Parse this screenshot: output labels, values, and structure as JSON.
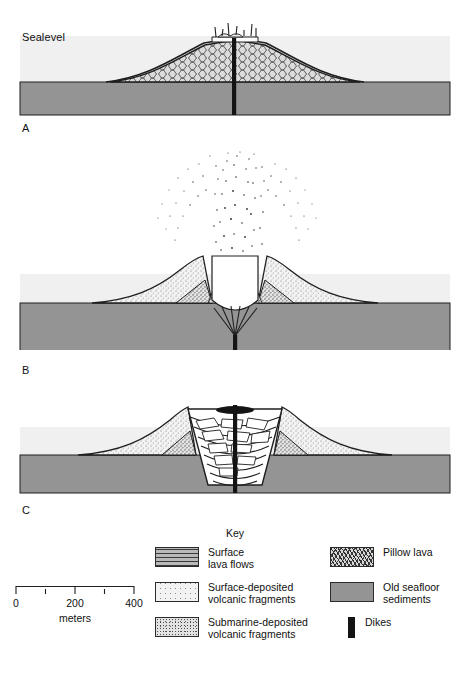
{
  "figure": {
    "sealevel_label": "Sealevel",
    "panels": [
      {
        "letter": "A",
        "caption": "Shallow submarine shield built of pillow lava with emergent summit vent and spatter at sealevel"
      },
      {
        "letter": "B",
        "caption": "Explosive eruption column; surface-deposited volcanic fragments build flanks above sealevel"
      },
      {
        "letter": "C",
        "caption": "Caldera collapse with inward-dipping fault blocks and breccia filling the vent"
      }
    ]
  },
  "key": {
    "title": "Key",
    "columns": [
      {
        "items": [
          {
            "label": "Surface\nlava flows",
            "pattern": "sw-surface-lava",
            "swatch_name": "surface-lava-flows"
          },
          {
            "label": "Surface-deposited\nvolcanic fragments",
            "pattern": "sw-surface-frag",
            "swatch_name": "surface-deposited-volcanic-fragments"
          },
          {
            "label": "Submarine-deposited\nvolcanic fragments",
            "pattern": "sw-submarine-frag",
            "swatch_name": "submarine-deposited-volcanic-fragments"
          }
        ]
      },
      {
        "items": [
          {
            "label": "Pillow lava",
            "pattern": "sw-pillow",
            "swatch_name": "pillow-lava"
          },
          {
            "label": "Old seafloor\nsediments",
            "pattern": "sw-seafloor",
            "swatch_name": "old-seafloor-sediments"
          },
          {
            "label": "Dikes",
            "pattern": "dike",
            "swatch_name": "dikes"
          }
        ]
      }
    ]
  },
  "scale": {
    "units": "meters",
    "labels": [
      "0",
      "200",
      "400"
    ],
    "label_positions": [
      0,
      59,
      118
    ],
    "tick_positions": [
      0,
      29.5,
      59,
      88.5,
      118
    ],
    "max_meters": 400
  },
  "colors": {
    "water": "#f0f0f0",
    "seafloor": "#949494",
    "dike": "#141414",
    "outline": "#1f1f1f",
    "pillow_fill": "#d7d7d7",
    "surface_frag_fill": "#f2f2f2",
    "submarine_frag_fill": "#e2e2e2",
    "page_background": "#ffffff"
  }
}
